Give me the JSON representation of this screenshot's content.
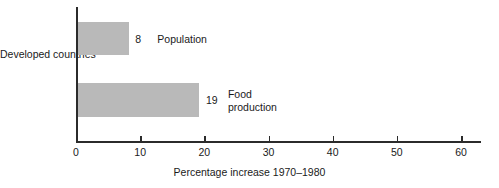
{
  "chart_data": {
    "type": "bar",
    "orientation": "horizontal",
    "title": "",
    "categories": [
      "Population",
      "Food production"
    ],
    "values": [
      8,
      19
    ],
    "value_labels": [
      "8",
      "19"
    ],
    "group_label": "Developed\ncountries",
    "group_label_lines": [
      "Developed",
      "countries"
    ],
    "xlabel": "Percentage increase 1970–1980",
    "ylabel": "",
    "xlim": [
      0,
      60
    ],
    "xticks": [
      0,
      10,
      20,
      30,
      40,
      50,
      60
    ],
    "xtick_labels": [
      "0",
      "10",
      "20",
      "30",
      "40",
      "50",
      "60"
    ],
    "grid": false,
    "legend": "none",
    "bar_color": "#b9b9b9",
    "axis_color": "#2b2b2b",
    "background_color": "#ffffff",
    "series": [
      {
        "name": "Population",
        "label": "Population",
        "value": 8,
        "value_label": "8"
      },
      {
        "name": "Food production",
        "label": "Food\nproduction",
        "value": 19,
        "value_label": "19"
      }
    ]
  }
}
